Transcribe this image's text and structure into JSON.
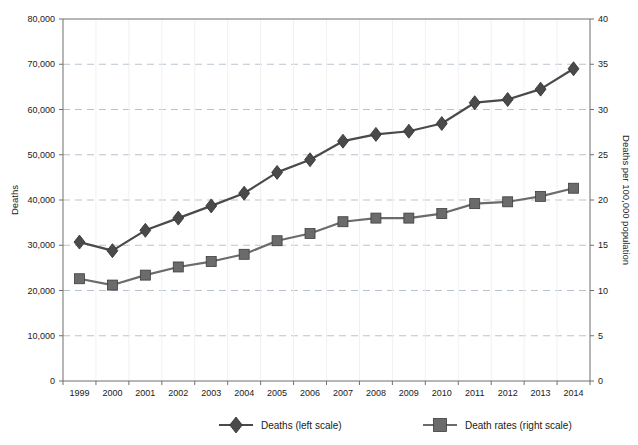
{
  "chart_data": {
    "type": "line",
    "title": "",
    "xlabel": "",
    "ylabel": "Deaths",
    "y2label": "Deaths per 100,000 population",
    "grid": true,
    "legend_position": "bottom",
    "ylim": [
      0,
      80000
    ],
    "y2lim": [
      0,
      40
    ],
    "yticks": [
      "0",
      "10,000",
      "20,000",
      "30,000",
      "40,000",
      "50,000",
      "60,000",
      "70,000",
      "80,000"
    ],
    "ytick_values": [
      0,
      10000,
      20000,
      30000,
      40000,
      50000,
      60000,
      70000,
      80000
    ],
    "y2ticks": [
      "0",
      "5",
      "10",
      "15",
      "20",
      "25",
      "30",
      "35",
      "40"
    ],
    "y2tick_values": [
      0,
      5,
      10,
      15,
      20,
      25,
      30,
      35,
      40
    ],
    "categories": [
      "1999",
      "2000",
      "2001",
      "2002",
      "2003",
      "2004",
      "2005",
      "2006",
      "2007",
      "2008",
      "2009",
      "2010",
      "2011",
      "2012",
      "2013",
      "2014"
    ],
    "series": [
      {
        "name": "Deaths (left scale)",
        "axis": "left",
        "marker": "diamond",
        "color": "#4a4a4a",
        "values": [
          30700,
          28800,
          33300,
          36000,
          38700,
          41500,
          46100,
          48900,
          53000,
          54500,
          55200,
          56900,
          61500,
          62200,
          64500,
          69000
        ]
      },
      {
        "name": "Death rates (right scale)",
        "axis": "right",
        "marker": "square",
        "color": "#6b6b6b",
        "values": [
          11.3,
          10.6,
          11.7,
          12.6,
          13.2,
          14.0,
          15.5,
          16.3,
          17.6,
          18.0,
          18.0,
          18.5,
          19.6,
          19.8,
          20.4,
          21.3
        ]
      }
    ]
  },
  "legend": {
    "items": [
      {
        "label": "Deaths (left scale)",
        "marker": "diamond",
        "color": "#4a4a4a"
      },
      {
        "label": "Death rates (right scale)",
        "marker": "square",
        "color": "#6b6b6b"
      }
    ]
  },
  "axes": {
    "left_title": "Deaths",
    "right_title": "Deaths per 100,000 population"
  }
}
